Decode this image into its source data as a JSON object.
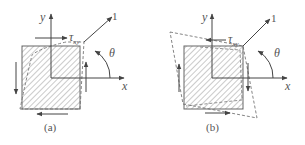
{
  "figure": {
    "type": "pure-shear-element-diagram",
    "colors": {
      "stroke": "#555555",
      "hatch": "#8a8a8a",
      "dashed": "#777777",
      "background": "#ffffff"
    },
    "panels": [
      {
        "id": "a",
        "caption": "(a)",
        "axis_x_label": "x",
        "axis_y_label": "y",
        "direction_label": "1",
        "angle_label": "θ",
        "shear_label": "τ",
        "shear_subscript": "xy",
        "shear_direction": "positive",
        "deformed_shape": "inner-dashed"
      },
      {
        "id": "b",
        "caption": "(b)",
        "axis_x_label": "x",
        "axis_y_label": "y",
        "direction_label": "1",
        "angle_label": "θ",
        "shear_label": "τ",
        "shear_subscript": "xy",
        "shear_direction": "negative",
        "deformed_shape": "outer-dashed"
      }
    ]
  }
}
